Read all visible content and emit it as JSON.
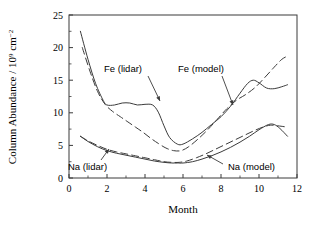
{
  "figure": {
    "background_color": "#ffffff",
    "line_color": "#3b3b3b",
    "axis_color": "#3b3b3b"
  },
  "axes": {
    "x_title": "Month",
    "y_title_main": "Column Abundance / 10",
    "y_title_exp": "9",
    "y_title_unit": " cm",
    "y_title_unit_exp": "−2",
    "x_ticks": [
      "0",
      "2",
      "4",
      "6",
      "8",
      "10",
      "12"
    ],
    "y_ticks": [
      "0",
      "5",
      "10",
      "15",
      "20",
      "25"
    ]
  },
  "annotations": {
    "fe_lidar": "Fe (lidar)",
    "fe_model": "Fe (model)",
    "na_lidar": "Na (lidar)",
    "na_model": "Na (model)"
  },
  "chart_data": {
    "type": "line",
    "title": "",
    "xlabel": "Month",
    "ylabel": "Column Abundance / 10^9 cm^-2",
    "xlim": [
      0,
      12
    ],
    "ylim": [
      0,
      25
    ],
    "xticks": [
      0,
      2,
      4,
      6,
      8,
      10,
      12
    ],
    "yticks": [
      0,
      5,
      10,
      15,
      20,
      25
    ],
    "grid": false,
    "legend": "inline-annotations",
    "series": [
      {
        "name": "Fe (lidar)",
        "style": "solid",
        "x": [
          0.6,
          1.0,
          1.4,
          1.8,
          2.0,
          2.4,
          2.8,
          3.2,
          3.6,
          4.0,
          4.4,
          4.7,
          5.0,
          5.3,
          5.7,
          6.0,
          6.5,
          7.0,
          7.5,
          8.0,
          8.5,
          9.0,
          9.4,
          9.7,
          10.0,
          10.4,
          10.8,
          11.2,
          11.5
        ],
        "y": [
          22.5,
          18.2,
          14.5,
          11.9,
          11.2,
          11.2,
          11.5,
          11.5,
          11.2,
          11.3,
          11.2,
          10.1,
          8.0,
          6.2,
          5.2,
          5.2,
          6.0,
          7.0,
          8.2,
          9.4,
          11.0,
          13.0,
          14.5,
          15.0,
          14.6,
          13.8,
          13.7,
          14.0,
          14.3
        ]
      },
      {
        "name": "Fe (model)",
        "style": "dashed",
        "x": [
          0.7,
          1.1,
          1.5,
          1.9,
          2.3,
          2.7,
          3.1,
          3.5,
          3.9,
          4.3,
          4.7,
          5.1,
          5.5,
          5.9,
          6.3,
          6.8,
          7.3,
          7.8,
          8.3,
          8.8,
          9.3,
          9.8,
          10.3,
          10.8,
          11.2,
          11.5
        ],
        "y": [
          20.0,
          16.4,
          13.3,
          11.3,
          10.2,
          9.4,
          8.6,
          7.8,
          7.0,
          6.1,
          5.3,
          4.6,
          4.2,
          4.2,
          4.8,
          6.0,
          7.4,
          9.0,
          10.6,
          11.9,
          12.8,
          13.9,
          15.4,
          17.0,
          18.2,
          18.7
        ]
      },
      {
        "name": "Na (lidar)",
        "style": "solid",
        "x": [
          0.6,
          1.0,
          1.5,
          2.0,
          2.5,
          3.0,
          3.5,
          4.0,
          4.5,
          5.0,
          5.4,
          5.7,
          6.0,
          6.5,
          7.0,
          7.5,
          8.0,
          8.5,
          9.0,
          9.5,
          10.0,
          10.5,
          10.8,
          11.1,
          11.5
        ],
        "y": [
          6.4,
          5.6,
          4.8,
          4.2,
          3.8,
          3.5,
          3.2,
          2.9,
          2.6,
          2.4,
          2.3,
          2.3,
          2.3,
          2.5,
          2.9,
          3.4,
          4.0,
          4.7,
          5.5,
          6.4,
          7.4,
          8.2,
          8.2,
          7.6,
          6.4
        ]
      },
      {
        "name": "Na (model)",
        "style": "dashed",
        "x": [
          0.6,
          1.0,
          1.5,
          2.0,
          2.5,
          3.0,
          3.5,
          4.0,
          4.5,
          5.0,
          5.4,
          5.8,
          6.2,
          6.7,
          7.2,
          7.7,
          8.2,
          8.7,
          9.2,
          9.7,
          10.2,
          10.6,
          11.0,
          11.5
        ],
        "y": [
          6.4,
          5.7,
          5.0,
          4.4,
          4.0,
          3.7,
          3.4,
          3.1,
          2.8,
          2.5,
          2.4,
          2.4,
          2.6,
          3.1,
          3.7,
          4.4,
          5.1,
          5.8,
          6.5,
          7.2,
          7.8,
          8.1,
          8.0,
          7.8
        ]
      }
    ]
  },
  "leader_lines": {
    "fe_lidar": {
      "from": [
        148,
        76
      ],
      "to": [
        160,
        101
      ]
    },
    "fe_model": {
      "from": [
        222,
        76
      ],
      "to": [
        233,
        105
      ]
    },
    "na_lidar": {
      "from": [
        101,
        160
      ],
      "to": [
        109,
        149
      ]
    },
    "na_model": {
      "from": [
        223,
        164
      ],
      "to": [
        207,
        155
      ]
    }
  }
}
